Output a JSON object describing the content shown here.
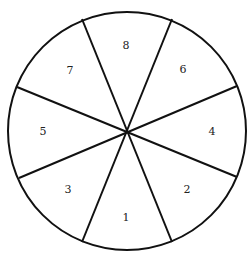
{
  "diagram": {
    "type": "spinner",
    "center": [
      127,
      131
    ],
    "radius": 119,
    "stroke_color": "#111111",
    "sectors": [
      {
        "label": "1",
        "x": 126,
        "y": 218
      },
      {
        "label": "2",
        "x": 187,
        "y": 190
      },
      {
        "label": "3",
        "x": 68,
        "y": 190
      },
      {
        "label": "4",
        "x": 212,
        "y": 132
      },
      {
        "label": "5",
        "x": 43,
        "y": 132
      },
      {
        "label": "6",
        "x": 183,
        "y": 70
      },
      {
        "label": "7",
        "x": 70,
        "y": 71
      },
      {
        "label": "8",
        "x": 126,
        "y": 46
      }
    ],
    "dividers": [
      {
        "x1": 82,
        "y1": 19,
        "x2": 172,
        "y2": 242
      },
      {
        "x1": 172,
        "y1": 19,
        "x2": 82,
        "y2": 242
      },
      {
        "x1": 17,
        "y1": 87,
        "x2": 237,
        "y2": 177
      },
      {
        "x1": 237,
        "y1": 86,
        "x2": 19,
        "y2": 178
      }
    ]
  }
}
